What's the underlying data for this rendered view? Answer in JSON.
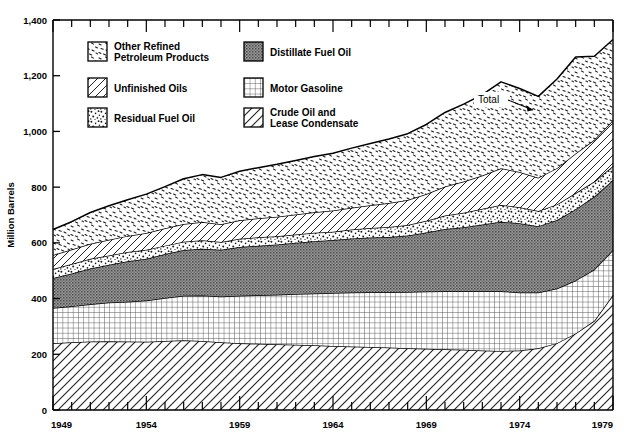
{
  "chart_data": {
    "type": "area",
    "title": "",
    "xlabel": "",
    "ylabel": "Million Barrels",
    "xlim": [
      1949,
      1979
    ],
    "ylim": [
      0,
      1400
    ],
    "ytick_labels": [
      "0",
      "200",
      "400",
      "600",
      "800",
      "1,000",
      "1,200",
      "1,400"
    ],
    "ytick_values": [
      0,
      200,
      400,
      600,
      800,
      1000,
      1200,
      1400
    ],
    "xtick_labels": [
      "1949",
      "1954",
      "1959",
      "1964",
      "1969",
      "1974",
      "1979"
    ],
    "xtick_values": [
      1949,
      1954,
      1959,
      1964,
      1969,
      1974,
      1979
    ],
    "grid": false,
    "stacked": true,
    "legend_position": "inside-top-left",
    "annotations": [
      {
        "text": "Total",
        "x": 1975,
        "y": 1180,
        "pointer_to_x": 1976.6,
        "pointer_to_y": 1120
      }
    ],
    "x": [
      1949,
      1950,
      1951,
      1952,
      1953,
      1954,
      1955,
      1956,
      1957,
      1958,
      1959,
      1960,
      1961,
      1962,
      1963,
      1964,
      1965,
      1966,
      1967,
      1968,
      1969,
      1970,
      1971,
      1972,
      1973,
      1974,
      1975,
      1976,
      1977,
      1978,
      1979
    ],
    "series": [
      {
        "name": "Crude Oil and Lease Condensate",
        "pattern": "diagonal-hatch-right",
        "values": [
          240,
          243,
          246,
          247,
          246,
          245,
          248,
          250,
          248,
          243,
          240,
          238,
          236,
          234,
          232,
          230,
          228,
          226,
          224,
          222,
          220,
          218,
          216,
          214,
          212,
          214,
          222,
          240,
          275,
          320,
          413
        ]
      },
      {
        "name": "Motor Gasoline",
        "pattern": "grid-crosshatch",
        "values": [
          126,
          129,
          134,
          139,
          143,
          148,
          154,
          160,
          163,
          164,
          170,
          174,
          178,
          182,
          186,
          190,
          194,
          197,
          199,
          202,
          205,
          208,
          210,
          212,
          214,
          208,
          200,
          196,
          190,
          184,
          161
        ]
      },
      {
        "name": "Distillate Fuel Oil",
        "pattern": "fine-dark-stipple",
        "values": [
          108,
          118,
          128,
          135,
          145,
          150,
          158,
          164,
          168,
          168,
          175,
          178,
          180,
          184,
          188,
          190,
          194,
          196,
          198,
          202,
          212,
          224,
          230,
          240,
          250,
          248,
          238,
          246,
          256,
          262,
          252
        ]
      },
      {
        "name": "Residual Fuel Oil",
        "pattern": "coarse-stipple",
        "values": [
          32,
          34,
          35,
          34,
          33,
          32,
          30,
          30,
          30,
          28,
          30,
          30,
          30,
          30,
          30,
          30,
          32,
          34,
          36,
          38,
          42,
          48,
          52,
          56,
          60,
          58,
          54,
          56,
          58,
          54,
          50
        ]
      },
      {
        "name": "Unfinished Oils",
        "pattern": "diagonal-hatch-left",
        "values": [
          50,
          52,
          54,
          56,
          58,
          60,
          62,
          64,
          66,
          64,
          66,
          68,
          70,
          72,
          74,
          76,
          78,
          82,
          86,
          90,
          96,
          104,
          112,
          120,
          132,
          126,
          120,
          130,
          142,
          150,
          164
        ]
      },
      {
        "name": "Other Refined Petroleum Products",
        "pattern": "sparse-speckle",
        "values": [
          92,
          100,
          112,
          122,
          130,
          140,
          150,
          162,
          170,
          168,
          176,
          182,
          188,
          194,
          200,
          206,
          214,
          222,
          230,
          238,
          250,
          266,
          278,
          290,
          310,
          300,
          292,
          320,
          346,
          300,
          290
        ]
      }
    ],
    "totals": [
      648,
      676,
      709,
      733,
      755,
      775,
      802,
      830,
      845,
      835,
      857,
      870,
      882,
      896,
      910,
      922,
      940,
      957,
      973,
      992,
      1025,
      1068,
      1098,
      1132,
      1178,
      1154,
      1126,
      1188,
      1267,
      1270,
      1330
    ]
  },
  "legend": {
    "entries": [
      {
        "label_line1": "Other Refined",
        "label_line2": "Petroleum Products",
        "key": "other-refined-petroleum-products"
      },
      {
        "label_line1": "Unfinished Oils",
        "label_line2": "",
        "key": "unfinished-oils"
      },
      {
        "label_line1": "Residual Fuel Oil",
        "label_line2": "",
        "key": "residual-fuel-oil"
      },
      {
        "label_line1": "Distillate Fuel Oil",
        "label_line2": "",
        "key": "distillate-fuel-oil"
      },
      {
        "label_line1": "Motor Gasoline",
        "label_line2": "",
        "key": "motor-gasoline"
      },
      {
        "label_line1": "Crude Oil and",
        "label_line2": "Lease Condensate",
        "key": "crude-oil-and-lease-condensate"
      }
    ]
  },
  "colors": {
    "ink": "#000000",
    "background": "#ffffff",
    "distillate_fill": "#8a8a8a",
    "motor_gasoline_fill": "#ffffff"
  }
}
